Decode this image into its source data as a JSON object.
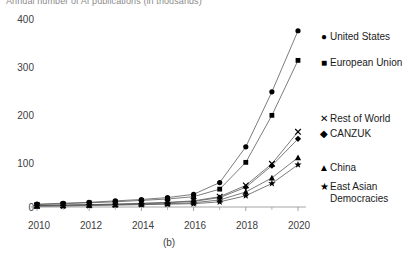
{
  "chart_data": {
    "type": "line",
    "title": "Annual number of AI publications (in thousands)",
    "caption": "(b)",
    "xlabel": "",
    "ylabel": "",
    "x": [
      2010,
      2011,
      2012,
      2013,
      2014,
      2015,
      2016,
      2017,
      2018,
      2019,
      2020
    ],
    "xticks": [
      "2010",
      "2012",
      "2014",
      "2016",
      "2018",
      "2020"
    ],
    "yticks": [
      "0",
      "100",
      "200",
      "300",
      "400"
    ],
    "xlim": [
      2010,
      2020
    ],
    "ylim": [
      0,
      400
    ],
    "grid": false,
    "legend_position": "right",
    "series": [
      {
        "name": "United States",
        "marker": "circle",
        "values": [
          6,
          8,
          10,
          13,
          16,
          20,
          27,
          52,
          128,
          245,
          375
        ]
      },
      {
        "name": "European Union",
        "marker": "square",
        "values": [
          5,
          7,
          9,
          11,
          14,
          17,
          22,
          38,
          95,
          195,
          312
        ]
      },
      {
        "name": "Rest of World",
        "marker": "cross",
        "values": [
          3,
          4,
          5,
          6,
          8,
          10,
          13,
          22,
          46,
          92,
          160
        ]
      },
      {
        "name": "CANZUK",
        "marker": "diamond",
        "values": [
          3,
          4,
          5,
          6,
          7,
          9,
          12,
          20,
          42,
          88,
          145
        ]
      },
      {
        "name": "China",
        "marker": "triangle",
        "values": [
          2,
          3,
          4,
          5,
          6,
          7,
          9,
          15,
          32,
          62,
          105
        ]
      },
      {
        "name": "East Asian Democracies",
        "marker": "star",
        "values": [
          2,
          2,
          3,
          4,
          5,
          6,
          7,
          11,
          24,
          50,
          90
        ]
      }
    ]
  },
  "legend": {
    "items": [
      {
        "label": "United States",
        "glyph": "●"
      },
      {
        "label": "European Union",
        "glyph": "■"
      },
      {
        "label": "Rest of World",
        "glyph": "✕"
      },
      {
        "label": "CANZUK",
        "glyph": "◆"
      },
      {
        "label": "China",
        "glyph": "▲"
      },
      {
        "label": "East Asian",
        "label2": "Democracies",
        "glyph": "★"
      }
    ]
  },
  "axes": {
    "y_labels": [
      "400",
      "300",
      "200",
      "100",
      "0"
    ],
    "x_labels": [
      "2010",
      "2012",
      "2014",
      "2016",
      "2018",
      "2020"
    ],
    "caption": "(b)"
  },
  "colors": {
    "line": "#5a5a5a",
    "marker": "#000000",
    "axis": "#9a9a9a",
    "text": "#404040"
  }
}
